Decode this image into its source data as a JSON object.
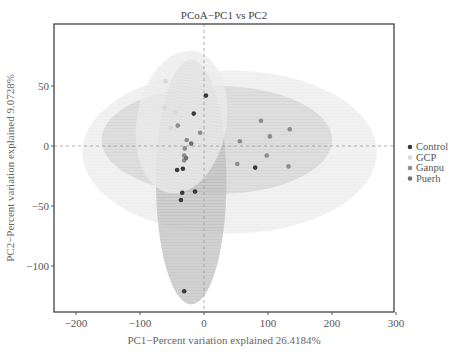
{
  "chart_data": {
    "type": "scatter",
    "title": "PCoA−PC1 vs PC2",
    "xlabel": "PC1−Percent variation explained 26.4184%",
    "ylabel": "PC2−Percent variation explained 9.0728%",
    "xlim": [
      -235,
      300
    ],
    "ylim": [
      -138,
      102
    ],
    "xticks": [
      -200,
      -100,
      0,
      100,
      200,
      300
    ],
    "xtick_labels": [
      "−200",
      "−100",
      "0",
      "100",
      "200",
      "300"
    ],
    "yticks": [
      50,
      0,
      -50,
      -100
    ],
    "ytick_labels": [
      "50",
      "0",
      "−50",
      "−100"
    ],
    "grid": false,
    "reference_lines": {
      "x": 0,
      "y": 0,
      "style": "dashed"
    },
    "legend": {
      "position": "right",
      "entries": [
        {
          "name": "Control",
          "color": "#3a3a3a"
        },
        {
          "name": "GCP",
          "color": "#d8d8d8"
        },
        {
          "name": "Ganpu",
          "color": "#8c8c8c"
        },
        {
          "name": "Puerh",
          "color": "#707070"
        }
      ]
    },
    "series": [
      {
        "name": "Control",
        "color": "#3a3a3a",
        "points": [
          [
            3,
            42
          ],
          [
            -16,
            27
          ],
          [
            -33,
            -19
          ],
          [
            -42,
            -20
          ],
          [
            -14,
            -38
          ],
          [
            -34,
            -39
          ],
          [
            -36,
            -45
          ],
          [
            -31,
            -121
          ],
          [
            80,
            -18
          ]
        ],
        "ellipse": {
          "cx": -20,
          "cy": -30,
          "rx": 55,
          "ry": 102,
          "angle": 0,
          "color": "#b8b8b8"
        }
      },
      {
        "name": "GCP",
        "color": "#d8d8d8",
        "points": [
          [
            -60,
            54
          ],
          [
            -62,
            32
          ],
          [
            -45,
            28
          ],
          [
            -52,
            15
          ]
        ],
        "ellipse": {
          "cx": -35,
          "cy": 20,
          "rx": 70,
          "ry": 60,
          "angle": -10,
          "color": "#e8e8e8"
        }
      },
      {
        "name": "Ganpu",
        "color": "#8c8c8c",
        "points": [
          [
            -41,
            17
          ],
          [
            -6,
            11
          ],
          [
            -27,
            5
          ],
          [
            -30,
            -2
          ],
          [
            -31,
            -8
          ],
          [
            -31,
            -12
          ],
          [
            56,
            4
          ],
          [
            89,
            21
          ],
          [
            103,
            8
          ],
          [
            134,
            14
          ],
          [
            52,
            -15
          ],
          [
            98,
            -8
          ],
          [
            132,
            -17
          ]
        ],
        "ellipse": {
          "cx": 20,
          "cy": 5,
          "rx": 180,
          "ry": 45,
          "angle": 0,
          "color": "#d0d0d0"
        }
      },
      {
        "name": "Puerh",
        "color": "#707070",
        "points": [
          [
            -28,
            -10
          ],
          [
            -20,
            2
          ]
        ],
        "ellipse": {
          "cx": 40,
          "cy": -5,
          "rx": 230,
          "ry": 68,
          "angle": 0,
          "color": "#eaeaea"
        }
      }
    ]
  },
  "frame": {
    "left": 54,
    "top": 24,
    "right": 394,
    "bottom": 312
  }
}
